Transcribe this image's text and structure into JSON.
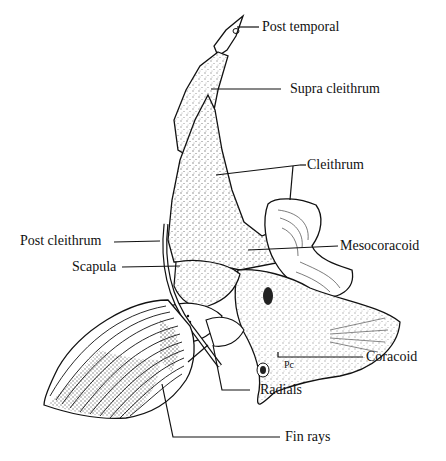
{
  "figure": {
    "labels": {
      "post_temporal": "Post temporal",
      "supra_cleithrum": "Supra cleithrum",
      "cleithrum": "Cleithrum",
      "post_cleithrum": "Post cleithrum",
      "mesocoracoid": "Mesocoracoid",
      "scapula": "Scapula",
      "coracoid": "Coracoid",
      "radials": "Radials",
      "fin_rays": "Fin rays"
    },
    "inline_marking": "Pc",
    "colors": {
      "ink": "#111111",
      "background": "#ffffff",
      "stipple": "#333333"
    }
  }
}
